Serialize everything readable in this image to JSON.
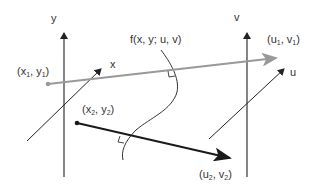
{
  "figure": {
    "function_label": "f(x, y; u, v)",
    "source_frame": {
      "vertical_axis_label": "y",
      "horizontal_axis_label": "x"
    },
    "target_frame": {
      "vertical_axis_label": "v",
      "horizontal_axis_label": "u"
    },
    "points": {
      "p1_source": {
        "var_a": "x",
        "sub_a": "1",
        "var_b": "y",
        "sub_b": "1"
      },
      "p1_target": {
        "var_a": "u",
        "sub_a": "1",
        "var_b": "v",
        "sub_b": "1"
      },
      "p2_source": {
        "var_a": "x",
        "sub_a": "2",
        "var_b": "y",
        "sub_b": "2"
      },
      "p2_target": {
        "var_a": "u",
        "sub_a": "2",
        "var_b": "v",
        "sub_b": "2"
      }
    },
    "colors": {
      "ray1": "#999999",
      "ray2": "#1a1a1a",
      "axes": "#333333",
      "curve": "#333333"
    }
  }
}
